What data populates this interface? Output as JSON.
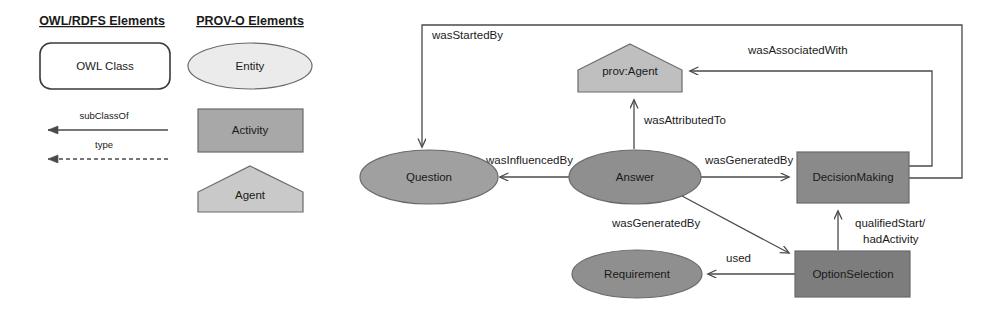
{
  "legend": {
    "owl": {
      "title": "OWL/RDFS Elements",
      "class_box_label": "OWL Class",
      "edges": [
        {
          "label": "subClassOf",
          "style": "solid"
        },
        {
          "label": "type",
          "style": "dashed"
        }
      ]
    },
    "provo": {
      "title": "PROV-O Elements",
      "shapes": [
        {
          "label": "Entity",
          "shape": "ellipse",
          "fill": "#ebebeb"
        },
        {
          "label": "Activity",
          "shape": "rect",
          "fill": "#a8a8a8"
        },
        {
          "label": "Agent",
          "shape": "pentagon",
          "fill": "#c9c9c9"
        }
      ]
    }
  },
  "diagram": {
    "nodes": [
      {
        "id": "provAgent",
        "label": "prov:Agent",
        "shape": "pentagon",
        "fill": "#bfbfbf"
      },
      {
        "id": "question",
        "label": "Question",
        "shape": "ellipse",
        "fill": "#a0a0a0"
      },
      {
        "id": "answer",
        "label": "Answer",
        "shape": "ellipse",
        "fill": "#8f8f8f"
      },
      {
        "id": "decisionMaking",
        "label": "DecisionMaking",
        "shape": "rect",
        "fill": "#8a8a8a"
      },
      {
        "id": "requirement",
        "label": "Requirement",
        "shape": "ellipse",
        "fill": "#8f8f8f"
      },
      {
        "id": "optionSelection",
        "label": "OptionSelection",
        "shape": "rect",
        "fill": "#7d7d7d"
      }
    ],
    "edges": [
      {
        "id": "e1",
        "label": "wasStartedBy",
        "from": "decisionMaking",
        "to": "question"
      },
      {
        "id": "e2",
        "label": "wasAssociatedWith",
        "from": "decisionMaking",
        "to": "provAgent"
      },
      {
        "id": "e3",
        "label": "wasAttributedTo",
        "from": "answer",
        "to": "provAgent"
      },
      {
        "id": "e4",
        "label": "wasInfluencedBy",
        "from": "answer",
        "to": "question"
      },
      {
        "id": "e5",
        "label": "wasGeneratedBy",
        "from": "answer",
        "to": "decisionMaking"
      },
      {
        "id": "e6",
        "label": "wasGeneratedBy",
        "from": "answer",
        "to": "optionSelection"
      },
      {
        "id": "e7",
        "label": "qualifiedStart/",
        "label2": "hadActivity",
        "from": "optionSelection",
        "to": "decisionMaking"
      },
      {
        "id": "e8",
        "label": "used",
        "from": "optionSelection",
        "to": "requirement"
      }
    ]
  },
  "colors": {
    "stroke": "#3a3a3a",
    "edge": "#4a4a4a",
    "text": "#1a1a1a",
    "background": "#ffffff"
  }
}
